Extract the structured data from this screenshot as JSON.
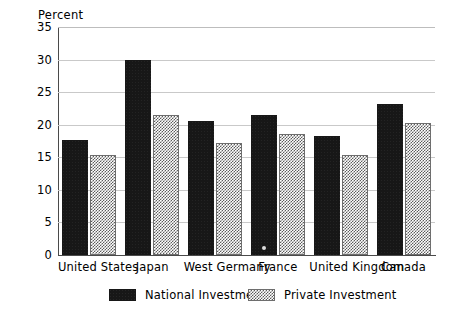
{
  "chart_data": {
    "type": "bar",
    "title": "",
    "subtitle": "",
    "xlabel": "",
    "ylabel": "Percent",
    "ylim": [
      0,
      35
    ],
    "yticks": [
      0,
      5,
      10,
      15,
      20,
      25,
      30,
      35
    ],
    "ytick_labels": [
      "0",
      "5",
      "10",
      "15",
      "20",
      "25",
      "30",
      "35"
    ],
    "grid": true,
    "legend_position": "bottom",
    "categories": [
      "United States",
      "Japan",
      "West Germany",
      "France",
      "United Kingdom",
      "Canada"
    ],
    "series": [
      {
        "name": "National Investment",
        "pattern": "solid-black",
        "color": "#171717",
        "values": [
          17.6,
          30.0,
          20.5,
          21.5,
          18.2,
          23.2
        ]
      },
      {
        "name": "Private Investment",
        "pattern": "checkerboard-hatch",
        "color": "#5c5c5c",
        "values": [
          15.4,
          21.5,
          17.2,
          18.6,
          15.4,
          20.2
        ]
      }
    ],
    "annotations": []
  },
  "legend": {
    "items": [
      {
        "label": "National Investment",
        "swatch": "solid-black-swatch"
      },
      {
        "label": "Private Investment",
        "swatch": "hatched-swatch"
      }
    ]
  },
  "colors": {
    "national": "#171717",
    "private_hatch": "#5c5c5c",
    "gridline": "#c9c9c9",
    "axis": "#4a4a4a",
    "background": "#ffffff",
    "text": "#000000"
  }
}
